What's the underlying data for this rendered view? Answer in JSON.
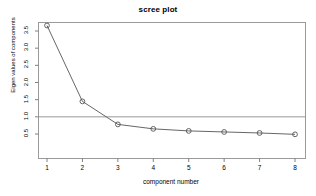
{
  "chart_data": {
    "type": "line",
    "title": "scree plot",
    "xlabel": "component number",
    "ylabel": "Eigen values of components",
    "x": [
      1,
      2,
      3,
      4,
      5,
      6,
      7,
      8
    ],
    "values": [
      3.66,
      1.45,
      0.78,
      0.65,
      0.59,
      0.56,
      0.53,
      0.49
    ],
    "series": [
      {
        "name": "eigenvalues",
        "values": [
          3.66,
          1.45,
          0.78,
          0.65,
          0.59,
          0.56,
          0.53,
          0.49
        ]
      }
    ],
    "categories": [
      "1",
      "2",
      "3",
      "4",
      "5",
      "6",
      "7",
      "8"
    ],
    "xtick_labels": [
      "1",
      "2",
      "3",
      "4",
      "5",
      "6",
      "7",
      "8"
    ],
    "ytick_labels": [
      "0.5",
      "1.0",
      "1.5",
      "2.0",
      "2.5",
      "3.0",
      "3.5"
    ],
    "ytick_values": [
      0.5,
      1.0,
      1.5,
      2.0,
      2.5,
      3.0,
      3.5
    ],
    "xlim": [
      0.6,
      8.4
    ],
    "ylim": [
      0.38,
      3.82
    ],
    "grid": false,
    "legend": null,
    "marker": "open-circle",
    "annotations": [
      {
        "type": "horizontal-reference-line",
        "value": 1.0,
        "label": "eigenvalue = 1 cutoff"
      }
    ],
    "colors": {
      "line": "#555555",
      "marker": "#555555",
      "axis": "#808080",
      "reference_line": "#999999",
      "text": "#000000",
      "background": "#ffffff"
    }
  }
}
